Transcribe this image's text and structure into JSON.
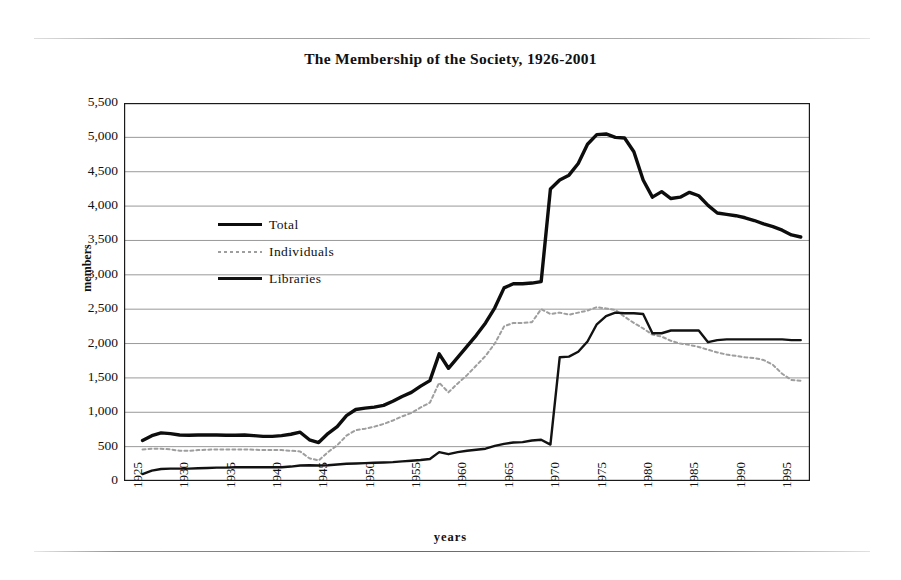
{
  "chart_data": {
    "type": "line",
    "title": "The Membership of the Society, 1926-2001",
    "xlabel": "years",
    "ylabel": "members",
    "xlim": [
      1925,
      1999
    ],
    "ylim": [
      0,
      5500
    ],
    "ytick_step": 500,
    "grid": true,
    "legend_position": "inside-left",
    "yticks": [
      "5,500",
      "5,000",
      "4,500",
      "4,000",
      "3,500",
      "3,000",
      "2,500",
      "2,000",
      "1,500",
      "1,000",
      "500",
      "0"
    ],
    "xticks": [
      "1925",
      "1930",
      "1935",
      "1940",
      "1945",
      "1950",
      "1955",
      "1960",
      "1965",
      "1970",
      "1975",
      "1980",
      "1985",
      "1990",
      "1995"
    ],
    "x": [
      1927,
      1928,
      1929,
      1930,
      1931,
      1932,
      1933,
      1934,
      1935,
      1936,
      1937,
      1938,
      1939,
      1940,
      1941,
      1942,
      1943,
      1944,
      1945,
      1946,
      1947,
      1948,
      1949,
      1950,
      1951,
      1952,
      1953,
      1954,
      1955,
      1956,
      1957,
      1958,
      1959,
      1960,
      1961,
      1962,
      1963,
      1964,
      1965,
      1966,
      1967,
      1968,
      1969,
      1970,
      1971,
      1972,
      1973,
      1974,
      1975,
      1976,
      1977,
      1978,
      1979,
      1980,
      1981,
      1982,
      1983,
      1984,
      1985,
      1986,
      1987,
      1988,
      1989,
      1990,
      1991,
      1992,
      1993,
      1994,
      1995,
      1996,
      1997,
      1998
    ],
    "series": [
      {
        "name": "Total",
        "color": "#0d0d0d",
        "style": "solid-thick",
        "values": [
          590,
          660,
          700,
          690,
          670,
          665,
          670,
          670,
          670,
          665,
          665,
          670,
          660,
          650,
          650,
          660,
          680,
          710,
          600,
          560,
          690,
          790,
          950,
          1040,
          1060,
          1075,
          1100,
          1160,
          1230,
          1290,
          1380,
          1460,
          1850,
          1640,
          1800,
          1960,
          2120,
          2300,
          2520,
          2810,
          2870,
          2870,
          2880,
          2900,
          4250,
          4380,
          4450,
          4620,
          4900,
          5040,
          5050,
          5000,
          4990,
          4790,
          4380,
          4130,
          4210,
          4110,
          4130,
          4200,
          4150,
          4010,
          3900,
          3880,
          3860,
          3830,
          3790,
          3740,
          3700,
          3650,
          3580,
          3550
        ]
      },
      {
        "name": "Individuals",
        "color": "#9e9e9e",
        "style": "dotted",
        "values": [
          460,
          470,
          470,
          460,
          440,
          440,
          450,
          455,
          460,
          460,
          460,
          460,
          455,
          450,
          450,
          450,
          440,
          430,
          330,
          300,
          420,
          520,
          660,
          740,
          760,
          790,
          830,
          880,
          940,
          990,
          1070,
          1140,
          1430,
          1290,
          1420,
          1540,
          1680,
          1820,
          2000,
          2250,
          2300,
          2300,
          2310,
          2500,
          2430,
          2450,
          2420,
          2450,
          2480,
          2530,
          2510,
          2490,
          2390,
          2300,
          2220,
          2130,
          2100,
          2040,
          2000,
          1980,
          1950,
          1910,
          1870,
          1840,
          1820,
          1800,
          1790,
          1760,
          1690,
          1560,
          1470,
          1460
        ]
      },
      {
        "name": "Libraries",
        "color": "#121212",
        "style": "solid-thin",
        "values": [
          100,
          150,
          175,
          180,
          180,
          180,
          185,
          190,
          195,
          195,
          200,
          200,
          200,
          200,
          200,
          200,
          210,
          225,
          230,
          225,
          230,
          240,
          250,
          255,
          260,
          265,
          270,
          275,
          285,
          295,
          305,
          320,
          420,
          390,
          420,
          440,
          455,
          470,
          510,
          540,
          560,
          565,
          590,
          600,
          530,
          1800,
          1810,
          1880,
          2030,
          2280,
          2400,
          2450,
          2440,
          2440,
          2430,
          2150,
          2150,
          2190,
          2190,
          2190,
          2190,
          2020,
          2050,
          2060,
          2060,
          2060,
          2060,
          2060,
          2060,
          2060,
          2050,
          2050
        ]
      }
    ]
  },
  "legend": {
    "items": [
      {
        "label": "Total",
        "swatch": "solid-thick-line"
      },
      {
        "label": "Individuals",
        "swatch": "dotted-line"
      },
      {
        "label": "Libraries",
        "swatch": "solid-thin-line"
      }
    ]
  }
}
